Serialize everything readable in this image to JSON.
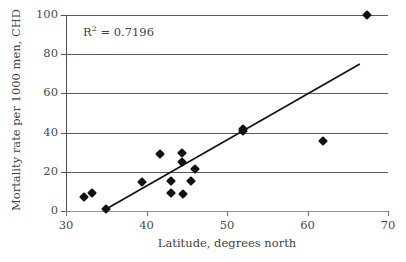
{
  "chart_data": {
    "type": "scatter",
    "title": "",
    "xlabel": "Latitude, degrees north",
    "ylabel": "Mortality rate per 1000 men, CHD",
    "xlim": [
      30,
      70
    ],
    "ylim": [
      0,
      100
    ],
    "xticks": [
      30,
      40,
      50,
      60,
      70
    ],
    "yticks": [
      0,
      20,
      40,
      60,
      80,
      100
    ],
    "grid": "horizontal",
    "legend": "none",
    "annotations": [
      {
        "text_prefix": "R",
        "text_exponent": "2",
        "text_suffix": " = 0.7196",
        "full_text": "R2 = 0.7196",
        "x": 38,
        "y": 92
      }
    ],
    "series": [
      {
        "name": "CHD mortality vs latitude",
        "marker": "diamond",
        "color": "#111111",
        "points": [
          {
            "x": 32.2,
            "y": 7
          },
          {
            "x": 33.2,
            "y": 9
          },
          {
            "x": 35.0,
            "y": 1
          },
          {
            "x": 39.5,
            "y": 15
          },
          {
            "x": 41.7,
            "y": 29
          },
          {
            "x": 43.0,
            "y": 15.5
          },
          {
            "x": 43.0,
            "y": 9
          },
          {
            "x": 44.4,
            "y": 29.5
          },
          {
            "x": 44.4,
            "y": 25
          },
          {
            "x": 44.5,
            "y": 8.5
          },
          {
            "x": 45.5,
            "y": 15.5
          },
          {
            "x": 46.0,
            "y": 21.5
          },
          {
            "x": 52.0,
            "y": 42
          },
          {
            "x": 52.0,
            "y": 41
          },
          {
            "x": 61.9,
            "y": 35.5
          },
          {
            "x": 67.4,
            "y": 100
          }
        ]
      }
    ],
    "trendline": {
      "name": "linear-fit",
      "color": "#111111",
      "x_start": 35.0,
      "y_start": 1,
      "x_end": 66.5,
      "y_end": 75,
      "r_squared": 0.7196
    }
  }
}
